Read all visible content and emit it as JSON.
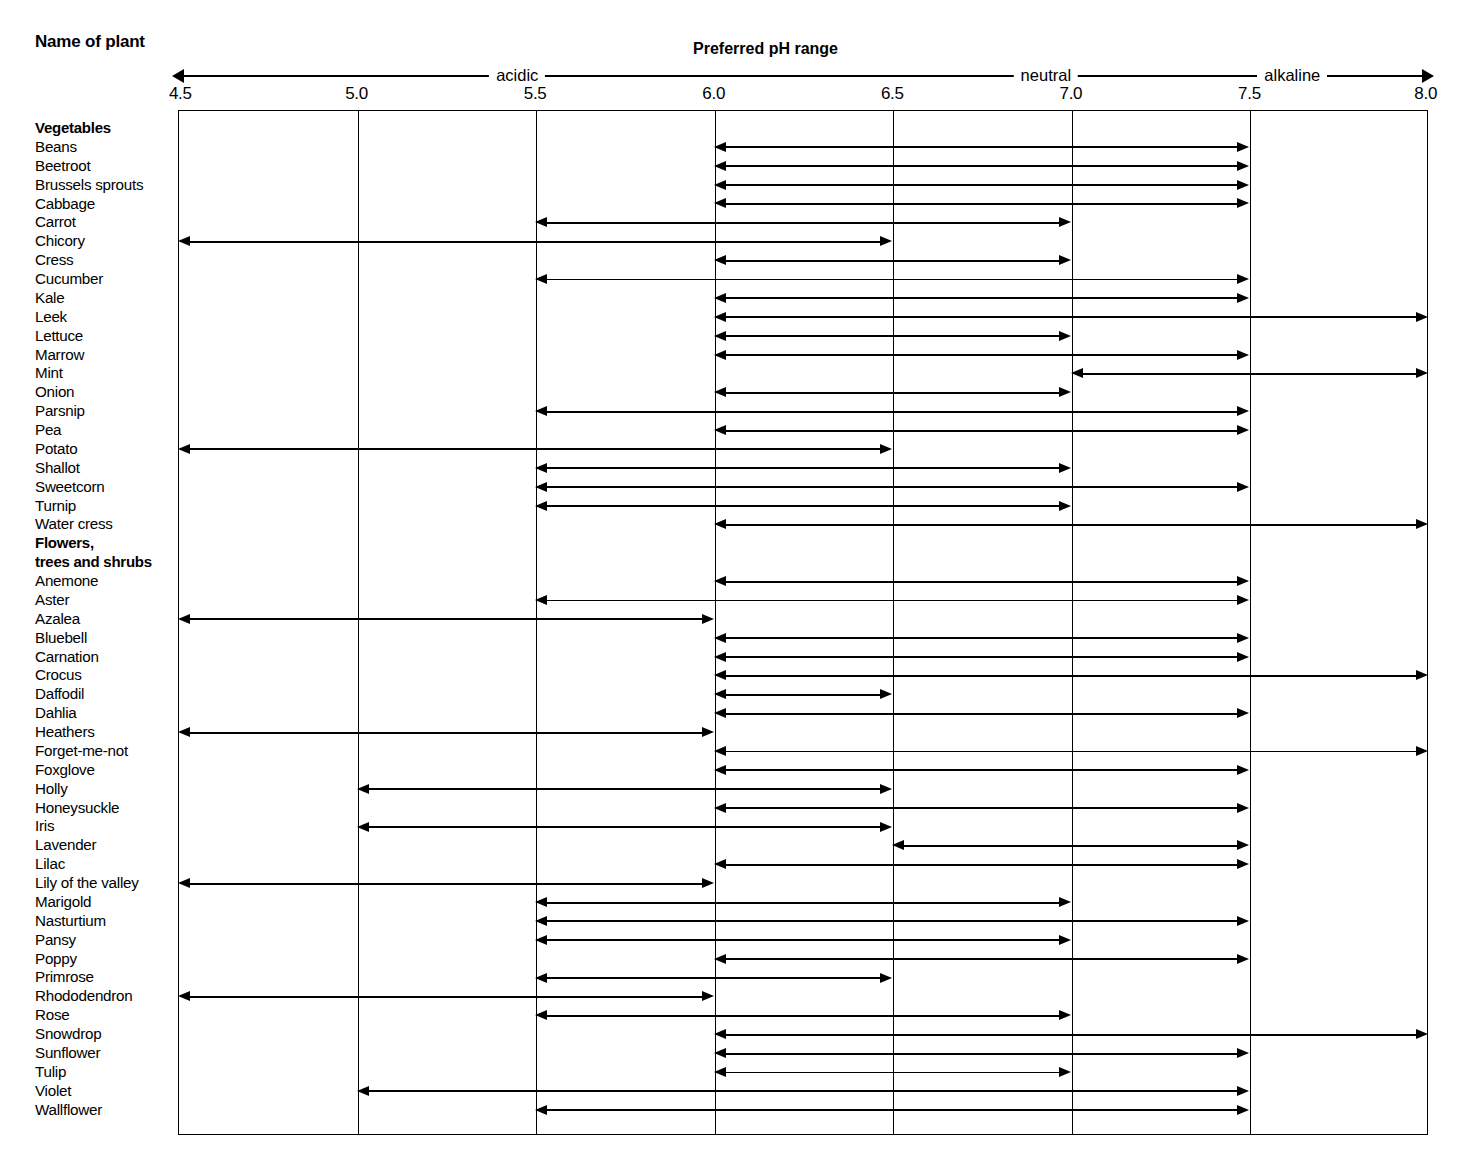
{
  "header": {
    "name_column_title": "Name of plant",
    "chart_title": "Preferred pH range"
  },
  "axis": {
    "bands": [
      {
        "label": "acidic",
        "at": 5.45
      },
      {
        "label": "neutral",
        "at": 6.93
      },
      {
        "label": "alkaline",
        "at": 7.62
      }
    ],
    "ticks": [
      "4.5",
      "5.0",
      "5.5",
      "6.0",
      "6.5",
      "7.0",
      "7.5",
      "8.0"
    ],
    "tick_values": [
      4.5,
      5.0,
      5.5,
      6.0,
      6.5,
      7.0,
      7.5,
      8.0
    ],
    "min": 4.5,
    "max": 8.0
  },
  "chart_data": {
    "type": "bar",
    "title": "Preferred pH range",
    "xlabel": "Preferred pH range",
    "ylabel": "Name of plant",
    "xlim": [
      4.5,
      8.0
    ],
    "grid": true,
    "legend": "none",
    "orientation": "horizontal-range",
    "groups": [
      {
        "name": "Vegetables",
        "items": [
          {
            "label": "Beans",
            "min": 6.0,
            "max": 7.5
          },
          {
            "label": "Beetroot",
            "min": 6.0,
            "max": 7.5
          },
          {
            "label": "Brussels sprouts",
            "min": 6.0,
            "max": 7.5
          },
          {
            "label": "Cabbage",
            "min": 6.0,
            "max": 7.5
          },
          {
            "label": "Carrot",
            "min": 5.5,
            "max": 7.0
          },
          {
            "label": "Chicory",
            "min": 4.5,
            "max": 6.5
          },
          {
            "label": "Cress",
            "min": 6.0,
            "max": 7.0
          },
          {
            "label": "Cucumber",
            "min": 5.5,
            "max": 7.5
          },
          {
            "label": "Kale",
            "min": 6.0,
            "max": 7.5
          },
          {
            "label": "Leek",
            "min": 6.0,
            "max": 8.0
          },
          {
            "label": "Lettuce",
            "min": 6.0,
            "max": 7.0
          },
          {
            "label": "Marrow",
            "min": 6.0,
            "max": 7.5
          },
          {
            "label": "Mint",
            "min": 7.0,
            "max": 8.0
          },
          {
            "label": "Onion",
            "min": 6.0,
            "max": 7.0
          },
          {
            "label": "Parsnip",
            "min": 5.5,
            "max": 7.5
          },
          {
            "label": "Pea",
            "min": 6.0,
            "max": 7.5
          },
          {
            "label": "Potato",
            "min": 4.5,
            "max": 6.5
          },
          {
            "label": "Shallot",
            "min": 5.5,
            "max": 7.0
          },
          {
            "label": "Sweetcorn",
            "min": 5.5,
            "max": 7.5
          },
          {
            "label": "Turnip",
            "min": 5.5,
            "max": 7.0
          },
          {
            "label": "Water cress",
            "min": 6.0,
            "max": 8.0
          }
        ]
      },
      {
        "name": "Flowers,\ntrees and shrubs",
        "name_line1": "Flowers,",
        "name_line2": "trees and shrubs",
        "items": [
          {
            "label": "Anemone",
            "min": 6.0,
            "max": 7.5
          },
          {
            "label": "Aster",
            "min": 5.5,
            "max": 7.5
          },
          {
            "label": "Azalea",
            "min": 4.5,
            "max": 6.0
          },
          {
            "label": "Bluebell",
            "min": 6.0,
            "max": 7.5
          },
          {
            "label": "Carnation",
            "min": 6.0,
            "max": 7.5
          },
          {
            "label": "Crocus",
            "min": 6.0,
            "max": 8.0
          },
          {
            "label": "Daffodil",
            "min": 6.0,
            "max": 6.5
          },
          {
            "label": "Dahlia",
            "min": 6.0,
            "max": 7.5
          },
          {
            "label": "Heathers",
            "min": 4.5,
            "max": 6.0
          },
          {
            "label": "Forget-me-not",
            "min": 6.0,
            "max": 8.0
          },
          {
            "label": "Foxglove",
            "min": 6.0,
            "max": 7.5
          },
          {
            "label": "Holly",
            "min": 5.0,
            "max": 6.5
          },
          {
            "label": "Honeysuckle",
            "min": 6.0,
            "max": 7.5
          },
          {
            "label": "Iris",
            "min": 5.0,
            "max": 6.5
          },
          {
            "label": "Lavender",
            "min": 6.5,
            "max": 7.5
          },
          {
            "label": "Lilac",
            "min": 6.0,
            "max": 7.5
          },
          {
            "label": "Lily of the valley",
            "min": 4.5,
            "max": 6.0
          },
          {
            "label": "Marigold",
            "min": 5.5,
            "max": 7.0
          },
          {
            "label": "Nasturtium",
            "min": 5.5,
            "max": 7.5
          },
          {
            "label": "Pansy",
            "min": 5.5,
            "max": 7.0
          },
          {
            "label": "Poppy",
            "min": 6.0,
            "max": 7.5
          },
          {
            "label": "Primrose",
            "min": 5.5,
            "max": 6.5
          },
          {
            "label": "Rhododendron",
            "min": 4.5,
            "max": 6.0
          },
          {
            "label": "Rose",
            "min": 5.5,
            "max": 7.0
          },
          {
            "label": "Snowdrop",
            "min": 6.0,
            "max": 8.0
          },
          {
            "label": "Sunflower",
            "min": 6.0,
            "max": 7.5
          },
          {
            "label": "Tulip",
            "min": 6.0,
            "max": 7.0
          },
          {
            "label": "Violet",
            "min": 5.0,
            "max": 7.5
          },
          {
            "label": "Wallflower",
            "min": 5.5,
            "max": 7.5
          }
        ]
      }
    ]
  },
  "colors": {
    "ink": "#000000",
    "background": "#ffffff"
  }
}
